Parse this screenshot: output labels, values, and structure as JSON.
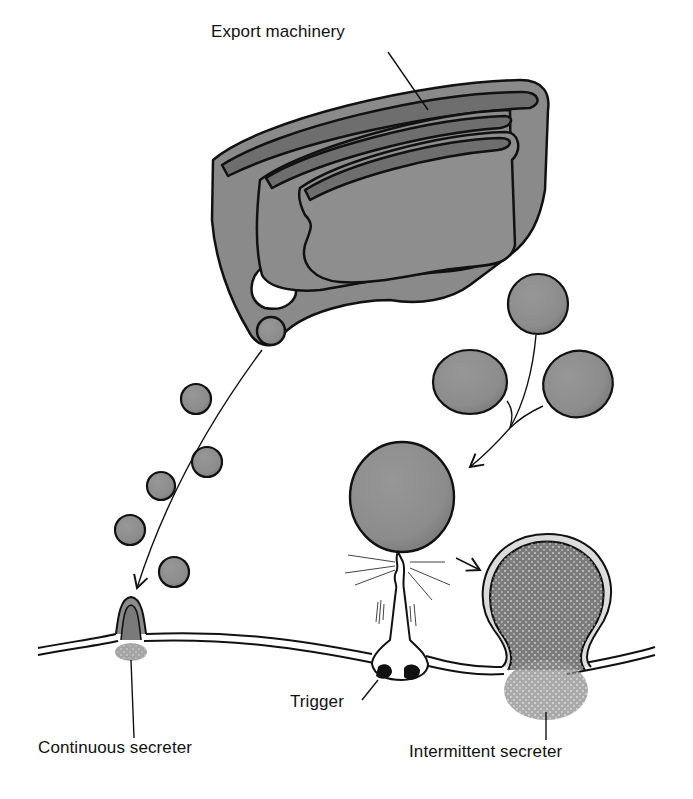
{
  "diagram": {
    "type": "biology-illustration",
    "labels": {
      "export_machinery": "Export machinery",
      "continuous_secreter": "Continuous secreter",
      "trigger": "Trigger",
      "intermittent_secreter": "Intermittent secreter"
    },
    "colors": {
      "organelle_fill": "#8c8c8c",
      "outline": "#111111",
      "background": "#ffffff",
      "stipple": "#555555"
    },
    "elements": [
      {
        "id": "golgi",
        "description": "Stacked cisternae (export machinery)"
      },
      {
        "id": "continuous-pathway",
        "description": "Small vesicles travel along arrow to continuous secretion site"
      },
      {
        "id": "regulated-pathway",
        "description": "Three vesicles merge into large storage granule, which fuses upon trigger"
      },
      {
        "id": "plasma-membrane",
        "description": "Double-line membrane across bottom"
      }
    ]
  }
}
